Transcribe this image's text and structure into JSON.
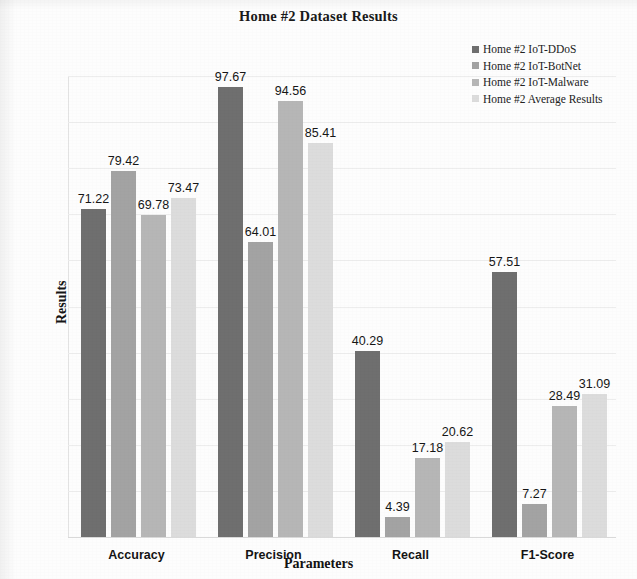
{
  "chart_data": {
    "type": "bar",
    "title": "Home #2 Dataset Results",
    "xlabel": "Parameters",
    "ylabel": "Results",
    "categories": [
      "Accuracy",
      "Precision",
      "Recall",
      "F1-Score"
    ],
    "ylim": [
      0,
      100
    ],
    "yticks": [
      0,
      10,
      20,
      30,
      40,
      50,
      60,
      70,
      80,
      90,
      100
    ],
    "grid": true,
    "legend_position": "top-right",
    "series": [
      {
        "name": "Home #2 IoT-DDoS",
        "color": "#6f6f6f",
        "values": [
          71.22,
          97.67,
          40.29,
          57.51
        ],
        "labels": [
          "71.22",
          "97.67",
          "40.29",
          "57.51"
        ]
      },
      {
        "name": "Home #2 IoT-BotNet",
        "color": "#a3a3a3",
        "values": [
          79.42,
          64.01,
          4.39,
          7.27
        ],
        "labels": [
          "79.42",
          "64.01",
          "4.39",
          "7.27"
        ]
      },
      {
        "name": "Home #2 IoT-Malware",
        "color": "#b6b6b6",
        "values": [
          69.78,
          94.56,
          17.18,
          28.49
        ],
        "labels": [
          "69.78",
          "94.56",
          "17.18",
          "28.49"
        ]
      },
      {
        "name": "Home #2 Average Results",
        "color": "#dcdcdc",
        "values": [
          73.47,
          85.41,
          20.62,
          31.09
        ],
        "labels": [
          "73.47",
          "85.41",
          "20.62",
          "31.09"
        ]
      }
    ]
  }
}
